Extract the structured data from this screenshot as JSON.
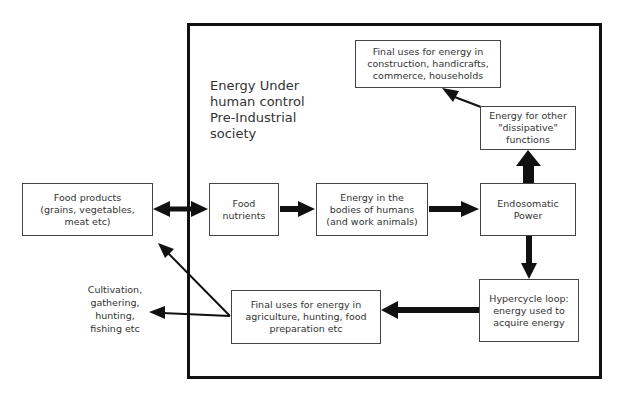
{
  "diagram": {
    "title": [
      "Energy Under",
      "human control",
      "Pre-Industrial",
      "society"
    ],
    "nodes": {
      "food_products": [
        "Food products",
        "(grains, vegetables,",
        "meat etc)"
      ],
      "food_nutrients": [
        "Food",
        "nutrients"
      ],
      "energy_bodies": [
        "Energy in the",
        "bodies of humans",
        "(and work animals)"
      ],
      "endosomatic": [
        "Endosomatic",
        "Power"
      ],
      "dissipative": [
        "Energy for other",
        "\"dissipative\"",
        "functions"
      ],
      "final_uses_top": [
        "Final uses for energy in",
        "construction, handicrafts,",
        "commerce, households"
      ],
      "hypercycle": [
        "Hypercycle loop:",
        "energy used to",
        "acquire energy"
      ],
      "final_uses_bottom": [
        "Final uses for energy in",
        "agriculture, hunting, food",
        "preparation etc"
      ],
      "cultivation": [
        "Cultivation,",
        "gathering,",
        "hunting,",
        "fishing etc"
      ]
    },
    "edges": [
      {
        "from": "food_products",
        "to": "food_nutrients",
        "type": "bidirectional-thick"
      },
      {
        "from": "food_nutrients",
        "to": "energy_bodies",
        "type": "thick"
      },
      {
        "from": "energy_bodies",
        "to": "endosomatic",
        "type": "thick"
      },
      {
        "from": "endosomatic",
        "to": "dissipative",
        "type": "thick"
      },
      {
        "from": "dissipative",
        "to": "final_uses_top",
        "type": "thin"
      },
      {
        "from": "endosomatic",
        "to": "hypercycle",
        "type": "medium"
      },
      {
        "from": "hypercycle",
        "to": "final_uses_bottom",
        "type": "medium"
      },
      {
        "from": "final_uses_bottom",
        "to": "food_products",
        "type": "thin"
      },
      {
        "from": "final_uses_bottom",
        "to": "cultivation",
        "type": "thin"
      }
    ]
  }
}
